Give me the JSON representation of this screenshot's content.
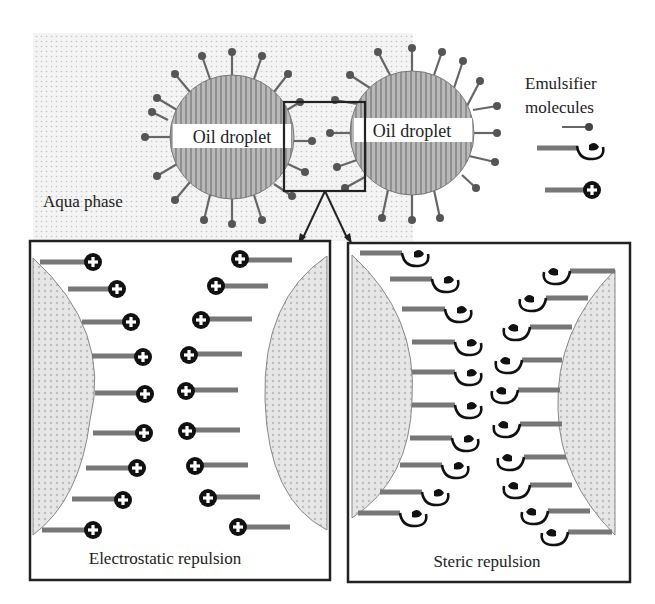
{
  "figure": {
    "droplet_left_label": "Oil droplet",
    "droplet_right_label": "Oil droplet",
    "aqua_phase_label": "Aqua phase",
    "legend": {
      "title_line1": "Emulsifier",
      "title_line2": "molecules",
      "items": [
        "small-molecule-emulsifier-icon",
        "polymer-steric-emulsifier-icon",
        "charged-ionic-emulsifier-icon"
      ]
    },
    "panel_left_caption": "Electrostatic repulsion",
    "panel_right_caption": "Steric repulsion",
    "colors": {
      "outline": "#222222",
      "droplet_fill": "#a8a8a8",
      "stem": "#6e6e6e",
      "background_dots": "#cfcfcf"
    }
  }
}
